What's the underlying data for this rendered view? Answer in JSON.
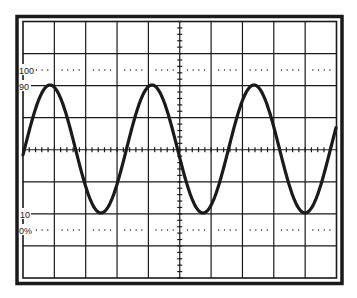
{
  "diagram": {
    "type": "oscilloscope-graticule",
    "colors": {
      "line": "#1a1a1a",
      "background": "#ffffff",
      "trace": "#1a1a1a"
    },
    "graticule": {
      "columns": 10,
      "rows": 8,
      "minor_ticks_per_division": 5
    },
    "labels": [
      {
        "id": "label-100",
        "text": "100",
        "y": 70
      },
      {
        "id": "label-90",
        "text": "90",
        "y": 86
      },
      {
        "id": "label-10",
        "text": "10",
        "y": 214
      },
      {
        "id": "label-0",
        "text": "0%",
        "y": 230
      }
    ],
    "reference_lines": [
      {
        "name": "100-percent",
        "y": 70
      },
      {
        "name": "0-percent",
        "y": 230
      }
    ],
    "trace": {
      "shape": "sine",
      "cycles_visible": 3.1,
      "period_px": 102,
      "amplitude_px": 64,
      "center_y": 149,
      "peak_x": [
        50,
        152,
        254
      ],
      "trough_x": [
        101,
        203,
        305
      ]
    }
  }
}
